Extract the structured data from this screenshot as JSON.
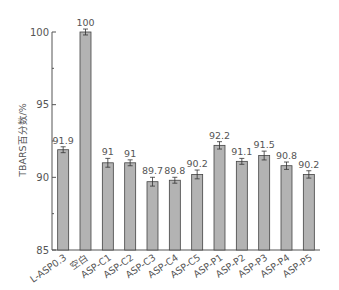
{
  "chart_data": {
    "type": "bar",
    "title": "",
    "xlabel": "",
    "ylabel": "TBARS百分数/%",
    "ylim": [
      85,
      100
    ],
    "yticks": [
      85,
      90,
      95,
      100
    ],
    "grid": false,
    "legend": null,
    "categories": [
      "L-ASP0.3",
      "空白",
      "ASP-C1",
      "ASP-C2",
      "ASP-C3",
      "ASP-C4",
      "ASP-C5",
      "ASP-P1",
      "ASP-P2",
      "ASP-P3",
      "ASP-P4",
      "ASP-P5"
    ],
    "values": [
      91.9,
      100,
      91,
      91,
      89.7,
      89.8,
      90.2,
      92.2,
      91.1,
      91.5,
      90.8,
      90.2
    ],
    "value_labels": [
      "91.9",
      "100",
      "91",
      "91",
      "89.7",
      "89.8",
      "90.2",
      "92.2",
      "91.1",
      "91.5",
      "90.8",
      "90.2"
    ],
    "error": [
      0.1,
      0.1,
      0.2,
      0.1,
      0.2,
      0.1,
      0.2,
      0.15,
      0.1,
      0.2,
      0.15,
      0.15
    ],
    "colors": {
      "bar_fill": "#b3b3b3",
      "bar_stroke": "#444444",
      "axis": "#555555"
    }
  }
}
